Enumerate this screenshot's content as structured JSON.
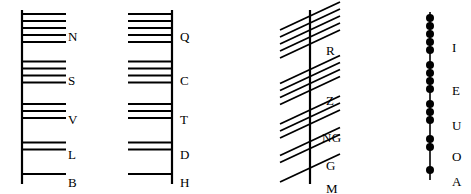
{
  "chart_data": {
    "type": "diagram",
    "groups": [
      {
        "name": "aicme-beithe",
        "stroke_style": "horizontal-right",
        "stem_x": 22,
        "stem_top": 10,
        "stem_bottom": 184,
        "stroke_length": 44,
        "stroke_spacing": 7,
        "letters": [
          {
            "label": "N",
            "strokes": 5,
            "label_x": 68,
            "label_y": 30,
            "center_y": 28
          },
          {
            "label": "S",
            "strokes": 4,
            "label_x": 68,
            "label_y": 74,
            "center_y": 72
          },
          {
            "label": "V",
            "strokes": 3,
            "label_x": 68,
            "label_y": 113,
            "center_y": 111
          },
          {
            "label": "L",
            "strokes": 2,
            "label_x": 68,
            "label_y": 148,
            "center_y": 146
          },
          {
            "label": "B",
            "strokes": 1,
            "label_x": 68,
            "label_y": 176,
            "center_y": 174
          }
        ]
      },
      {
        "name": "aicme-huatha",
        "stroke_style": "horizontal-left",
        "stem_x": 172,
        "stem_top": 10,
        "stem_bottom": 184,
        "stroke_length": 44,
        "stroke_spacing": 7,
        "letters": [
          {
            "label": "Q",
            "strokes": 5,
            "label_x": 180,
            "label_y": 30,
            "center_y": 28
          },
          {
            "label": "C",
            "strokes": 4,
            "label_x": 180,
            "label_y": 74,
            "center_y": 72
          },
          {
            "label": "T",
            "strokes": 3,
            "label_x": 180,
            "label_y": 113,
            "center_y": 111
          },
          {
            "label": "D",
            "strokes": 2,
            "label_x": 180,
            "label_y": 148,
            "center_y": 146
          },
          {
            "label": "H",
            "strokes": 1,
            "label_x": 180,
            "label_y": 176,
            "center_y": 174
          }
        ]
      },
      {
        "name": "aicme-muine",
        "stroke_style": "diagonal-crossing",
        "stem_x": 310,
        "stem_top": 10,
        "stem_bottom": 184,
        "stroke_length": 44,
        "stroke_spacing": 7,
        "letters": [
          {
            "label": "R",
            "strokes": 5,
            "label_x": 326,
            "label_y": 44,
            "center_y": 30
          },
          {
            "label": "Z",
            "strokes": 4,
            "label_x": 326,
            "label_y": 94,
            "center_y": 80
          },
          {
            "label": "NG",
            "strokes": 3,
            "label_x": 322,
            "label_y": 131,
            "center_y": 117
          },
          {
            "label": "G",
            "strokes": 2,
            "label_x": 326,
            "label_y": 159,
            "center_y": 145
          },
          {
            "label": "M",
            "strokes": 1,
            "label_x": 326,
            "label_y": 182,
            "center_y": 168
          }
        ]
      },
      {
        "name": "aicme-ailme",
        "stroke_style": "dot-notch",
        "stem_x": 430,
        "stem_top": 12,
        "stem_bottom": 180,
        "dot_radius": 4,
        "dot_spacing": 8,
        "letters": [
          {
            "label": "I",
            "strokes": 5,
            "label_x": 452,
            "label_y": 41,
            "center_y": 34
          },
          {
            "label": "E",
            "strokes": 4,
            "label_x": 452,
            "label_y": 84,
            "center_y": 77
          },
          {
            "label": "U",
            "strokes": 3,
            "label_x": 452,
            "label_y": 119,
            "center_y": 112
          },
          {
            "label": "O",
            "strokes": 2,
            "label_x": 452,
            "label_y": 150,
            "center_y": 143
          },
          {
            "label": "A",
            "strokes": 1,
            "label_x": 452,
            "label_y": 175,
            "center_y": 170
          }
        ]
      }
    ],
    "colors": {
      "ink": "#000000",
      "background": "#ffffff"
    }
  }
}
